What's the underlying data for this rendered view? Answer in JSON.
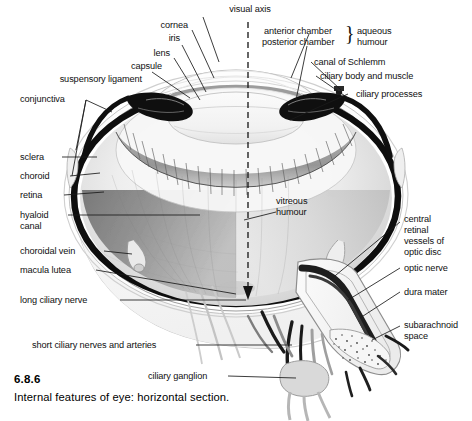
{
  "figure": {
    "number": "6.8.6",
    "caption": "Internal features of eye: horizontal section.",
    "style": "grayscale anatomical illustration"
  },
  "colors": {
    "background": "#ffffff",
    "ink": "#101010",
    "leader_line": "#1a1a1a",
    "sclera_outline": "#111111",
    "choroid_dark": "#0d0d0d",
    "retina_mid": "#8e8e8e",
    "vitreous_light": "#e9e9e9",
    "iris_dark": "#111111",
    "lens_pale": "#f4f4f4",
    "nerve_dark": "#262626",
    "vessel_gray": "#9a9a9a"
  },
  "labels": {
    "visual_axis": "visual axis",
    "cornea": "cornea",
    "iris": "iris",
    "lens": "lens",
    "capsule": "capsule",
    "suspensory_ligament": "suspensory ligament",
    "conjunctiva": "conjunctiva",
    "anterior_chamber": "anterior chamber",
    "posterior_chamber": "posterior chamber",
    "aqueous_humour_line1": "aqueous",
    "aqueous_humour_line2": "humour",
    "brace_glyph": "}",
    "canal_of_schlemm": "canal of Schlemm",
    "ciliary_body_and_muscle": "ciliary body and muscle",
    "ciliary_processes": "ciliary processes",
    "sclera": "sclera",
    "choroid": "choroid",
    "retina": "retina",
    "hyaloid_line1": "hyaloid",
    "hyaloid_line2": "canal",
    "choroidal_vein": "choroidal vein",
    "macula_lutea": "macula lutea",
    "long_ciliary_nerve": "long ciliary nerve",
    "short_ciliary_nerves_and_arteries": "short ciliary nerves and arteries",
    "vitreous_line1": "vitreous",
    "vitreous_line2": "humour",
    "central_retinal_line1": "central",
    "central_retinal_line2": "retinal",
    "central_retinal_line3": "vessels of",
    "central_retinal_line4": "optic disc",
    "optic_nerve": "optic nerve",
    "dura_mater": "dura mater",
    "subarachnoid_line1": "subarachnoid",
    "subarachnoid_line2": "space",
    "ciliary_ganglion": "ciliary ganglion"
  }
}
